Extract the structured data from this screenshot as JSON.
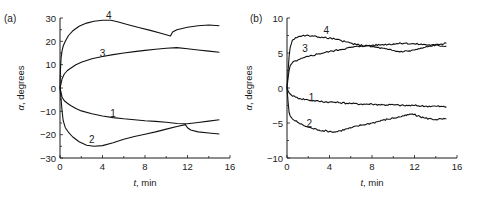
{
  "chart_data": [
    {
      "type": "line",
      "panel_label": "(a)",
      "xlabel_var": "t",
      "xlabel_unit": ", min",
      "ylabel_var": "α",
      "ylabel_unit": ", degrees",
      "xlim": [
        0,
        16
      ],
      "ylim": [
        -30,
        30
      ],
      "xticks": [
        0,
        4,
        8,
        12,
        16
      ],
      "xminor": [
        2,
        6,
        10,
        14
      ],
      "yticks": [
        -30,
        -20,
        -10,
        0,
        10,
        20,
        30
      ],
      "yminor": [
        -25,
        -15,
        -5,
        5,
        15,
        25
      ],
      "grid": false,
      "series": [
        {
          "name": "1",
          "label_at": [
            5.0,
            -11
          ],
          "x": [
            0,
            0.1,
            0.2,
            0.4,
            0.7,
            1,
            1.5,
            2,
            3,
            4,
            5,
            6,
            7,
            8,
            9,
            10,
            11,
            12,
            13,
            14,
            15
          ],
          "y": [
            0,
            -2,
            -4,
            -5.5,
            -6.5,
            -7.5,
            -8.8,
            -9.8,
            -11,
            -12,
            -12.7,
            -13.2,
            -13.6,
            -14,
            -14.3,
            -14.7,
            -15.2,
            -15.3,
            -14.8,
            -14.2,
            -13.6
          ]
        },
        {
          "name": "2",
          "label_at": [
            3.0,
            -22
          ],
          "x": [
            0,
            0.1,
            0.2,
            0.3,
            0.5,
            0.8,
            1.2,
            1.8,
            2.5,
            3.2,
            4,
            5,
            6,
            7,
            8,
            9,
            10,
            11,
            11.8,
            12,
            12.3,
            13,
            14,
            15
          ],
          "y": [
            0,
            -5,
            -10,
            -14,
            -17,
            -19,
            -21,
            -23,
            -24.5,
            -25,
            -24.7,
            -23.5,
            -22,
            -20.8,
            -19.8,
            -18.8,
            -17.6,
            -16.5,
            -15.7,
            -17,
            -18,
            -18.8,
            -19.3,
            -19.7
          ]
        },
        {
          "name": "3",
          "label_at": [
            4.0,
            15
          ],
          "x": [
            0,
            0.1,
            0.2,
            0.4,
            0.7,
            1,
            1.5,
            2,
            3,
            4,
            5,
            6,
            7,
            8,
            9,
            10,
            11,
            12,
            13,
            14,
            15
          ],
          "y": [
            0,
            2,
            4,
            6,
            7.5,
            8.5,
            10,
            11,
            12.5,
            13.5,
            14.3,
            15,
            15.6,
            16.1,
            16.6,
            17,
            17.3,
            16.8,
            16.3,
            15.8,
            15.3
          ]
        },
        {
          "name": "4",
          "label_at": [
            4.6,
            31
          ],
          "x": [
            0,
            0.05,
            0.1,
            0.2,
            0.3,
            0.5,
            0.8,
            1.2,
            1.8,
            2.5,
            3.2,
            4,
            4.8,
            5.5,
            6.5,
            7.5,
            8.5,
            9.5,
            10.4,
            10.6,
            11,
            12,
            13,
            14,
            15
          ],
          "y": [
            0,
            8,
            13,
            16,
            18,
            20,
            22.5,
            24.5,
            26.5,
            27.8,
            28.6,
            29,
            29,
            28.3,
            27,
            25.8,
            24.7,
            23.5,
            22.3,
            24,
            25,
            26,
            26.7,
            27,
            26.7
          ]
        }
      ]
    },
    {
      "type": "line",
      "panel_label": "(b)",
      "xlabel_var": "t",
      "xlabel_unit": ", min",
      "ylabel_var": "α",
      "ylabel_unit": ", degrees",
      "xlim": [
        0,
        16
      ],
      "ylim": [
        -10,
        10
      ],
      "xticks": [
        0,
        4,
        8,
        12,
        16
      ],
      "xminor": [
        2,
        6,
        10,
        14
      ],
      "yticks": [
        -10,
        -5,
        0,
        5,
        10
      ],
      "yminor": [
        -7.5,
        -2.5,
        2.5,
        7.5
      ],
      "grid": false,
      "series": [
        {
          "name": "1",
          "label_at": [
            2.3,
            -1.3
          ],
          "x": [
            0,
            0.1,
            0.2,
            0.4,
            0.8,
            1.2,
            2,
            3,
            4,
            5,
            6,
            7,
            8,
            9,
            10,
            11,
            12,
            13,
            14,
            15
          ],
          "y": [
            0,
            -0.4,
            -0.7,
            -1.0,
            -1.3,
            -1.5,
            -1.7,
            -1.9,
            -2.0,
            -2.1,
            -2.2,
            -2.3,
            -2.3,
            -2.4,
            -2.4,
            -2.5,
            -2.5,
            -2.6,
            -2.6,
            -2.7
          ]
        },
        {
          "name": "2",
          "label_at": [
            2.1,
            -5.0
          ],
          "x": [
            0,
            0.1,
            0.2,
            0.3,
            0.5,
            1,
            1.5,
            2,
            3,
            4,
            4.5,
            5,
            6,
            7,
            8,
            9,
            10,
            11,
            11.8,
            12.3,
            13,
            14,
            15
          ],
          "y": [
            0,
            -2,
            -3.5,
            -4.0,
            -4.4,
            -4.9,
            -5.3,
            -5.6,
            -6.0,
            -6.2,
            -6.3,
            -6.1,
            -5.7,
            -5.3,
            -5.0,
            -4.6,
            -4.3,
            -4.0,
            -3.7,
            -4.0,
            -4.3,
            -4.5,
            -4.4
          ]
        },
        {
          "name": "3",
          "label_at": [
            1.7,
            5.6
          ],
          "x": [
            0,
            0.1,
            0.2,
            0.3,
            0.5,
            0.8,
            1.2,
            2,
            3,
            4,
            5,
            6,
            7,
            8,
            9,
            10,
            11,
            12,
            13,
            14,
            15
          ],
          "y": [
            0,
            1.5,
            2.5,
            3.2,
            3.6,
            3.9,
            4.1,
            4.5,
            4.9,
            5.2,
            5.5,
            5.8,
            6.0,
            6.1,
            6.2,
            6.3,
            6.4,
            6.3,
            6.2,
            6.1,
            6.0
          ]
        },
        {
          "name": "4",
          "label_at": [
            3.7,
            8.2
          ],
          "x": [
            0,
            0.1,
            0.2,
            0.3,
            0.5,
            0.8,
            1.2,
            1.8,
            2.5,
            3.5,
            4.5,
            5.5,
            6.5,
            7.5,
            8.5,
            9.5,
            10.5,
            11.5,
            12.5,
            13.5,
            14.5,
            15
          ],
          "y": [
            0,
            2.5,
            4.5,
            5.8,
            6.8,
            7.2,
            7.4,
            7.5,
            7.4,
            7.2,
            7.0,
            6.6,
            6.2,
            6.0,
            5.8,
            5.5,
            5.2,
            5.3,
            5.6,
            6.0,
            6.3,
            6.4
          ]
        }
      ]
    }
  ]
}
